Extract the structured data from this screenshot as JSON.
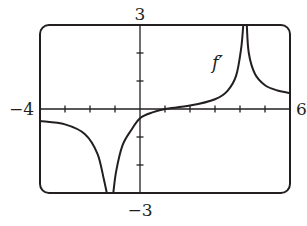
{
  "chart_data": {
    "type": "line",
    "title": "",
    "xlabel": "",
    "ylabel": "",
    "xlim": [
      -4,
      6
    ],
    "ylim": [
      -3,
      3
    ],
    "x_tick_labels": [
      "-4",
      "6"
    ],
    "y_tick_labels": [
      "3",
      "-3"
    ],
    "x_ticks_step": 1,
    "y_ticks_step": 1,
    "grid": false,
    "series": [
      {
        "name": "f'",
        "label": "f′",
        "vertical_asymptotes": [
          -1.2,
          4.2
        ],
        "points_left": [
          [
            -4,
            -0.43
          ],
          [
            -3,
            -0.55
          ],
          [
            -2.2,
            -0.9
          ],
          [
            -1.7,
            -1.6
          ],
          [
            -1.45,
            -2.5
          ],
          [
            -1.33,
            -3
          ]
        ],
        "points_middle": [
          [
            -1.07,
            -3
          ],
          [
            -0.95,
            -2.2
          ],
          [
            -0.7,
            -1.3
          ],
          [
            -0.35,
            -0.75
          ],
          [
            0,
            -0.33
          ],
          [
            0.5,
            -0.12
          ],
          [
            1,
            0
          ],
          [
            2,
            0.12
          ],
          [
            3,
            0.35
          ],
          [
            3.5,
            0.65
          ],
          [
            3.85,
            1.2
          ],
          [
            4.05,
            2.2
          ],
          [
            4.13,
            3
          ]
        ],
        "points_right": [
          [
            4.27,
            3
          ],
          [
            4.35,
            2.0
          ],
          [
            4.6,
            1.25
          ],
          [
            5.0,
            0.85
          ],
          [
            5.5,
            0.66
          ],
          [
            6,
            0.57
          ]
        ]
      }
    ],
    "annotations": [
      {
        "text": "f′",
        "x": 3.2,
        "y": 1.65
      }
    ]
  },
  "labels": {
    "y_top": "3",
    "y_bottom": "−3",
    "x_left": "−4",
    "x_right": "6",
    "curve": "f′"
  }
}
